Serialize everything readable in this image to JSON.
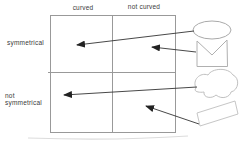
{
  "diagram": {
    "type": "classification-matrix",
    "columns": [
      "curved",
      "not curved"
    ],
    "rows": [
      "symmetrical",
      "not symmetrical"
    ],
    "shapes": [
      {
        "name": "ellipse-shape",
        "maps_to": {
          "row": "symmetrical",
          "column": "curved"
        }
      },
      {
        "name": "envelope-shape",
        "maps_to": {
          "row": "symmetrical",
          "column": "not curved"
        }
      },
      {
        "name": "cloud-shape",
        "maps_to": {
          "row": "not symmetrical",
          "column": "curved"
        }
      },
      {
        "name": "parallelogram-shape",
        "maps_to": {
          "row": "not symmetrical",
          "column": "not curved"
        }
      }
    ],
    "colors": {
      "background": "#ffffff",
      "grid": "#999999",
      "arrow": "#333333",
      "shape_outline": "#b8b8b8",
      "text": "#3a3a3a"
    }
  }
}
